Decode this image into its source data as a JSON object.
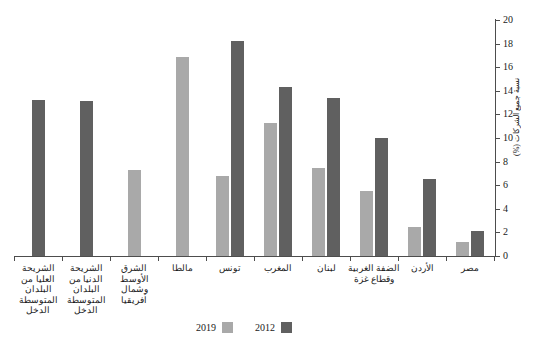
{
  "chart_data": {
    "type": "bar",
    "title": "",
    "subtitle": "",
    "xlabel": "",
    "ylabel": "نسبة جميع الشركات (%)",
    "ylim": [
      0,
      20
    ],
    "ytick_step": 2,
    "ytick_labels": [
      "0",
      "2",
      "4",
      "6",
      "8",
      "10",
      "12",
      "14",
      "16",
      "18",
      "20"
    ],
    "yaxis_position": "right",
    "grid": false,
    "legend_position": "bottom",
    "direction": "rtl",
    "categories": [
      "الشريحة العليا من البلدان المتوسطة الدخل",
      "الشريحة الدنيا من البلدان المتوسطة الدخل",
      "الشرق الأوسط وشمال أفريقيا",
      "مالطا",
      "تونس",
      "المغرب",
      "لبنان",
      "الضفة الغربية وقطاع غزة",
      "الأردن",
      "مصر"
    ],
    "series": [
      {
        "name": "2019",
        "color": "#a9a9a9",
        "values": [
          null,
          null,
          7.3,
          16.9,
          6.8,
          11.3,
          7.5,
          5.5,
          2.5,
          1.2
        ]
      },
      {
        "name": "2012",
        "color": "#606060",
        "values": [
          13.2,
          13.1,
          null,
          null,
          18.2,
          14.3,
          13.4,
          10.0,
          6.5,
          2.1
        ]
      }
    ]
  },
  "legend": {
    "items": [
      {
        "label": "2019",
        "swatch": "legend-swatch-2019"
      },
      {
        "label": "2012",
        "swatch": "legend-swatch-2012"
      }
    ]
  },
  "colors": {
    "series_2019": "#a9a9a9",
    "series_2012": "#606060",
    "axis": "#4d4d4d",
    "text": "#1a1a1a",
    "background": "#ffffff"
  }
}
